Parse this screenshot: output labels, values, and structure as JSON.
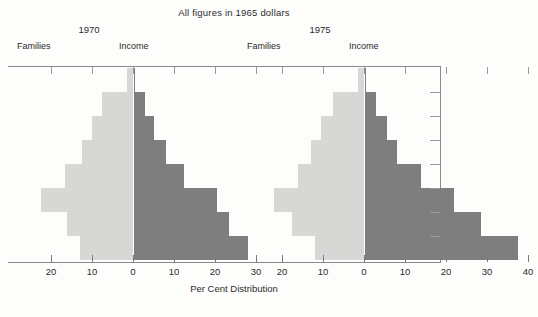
{
  "header": {
    "sup_title": "All figures in 1965 dollars",
    "axis_title": "Per Cent Distribution"
  },
  "panels": [
    {
      "year": "1970",
      "left_label": "Families",
      "right_label": "Income"
    },
    {
      "year": "1975",
      "left_label": "Families",
      "right_label": "Income"
    }
  ],
  "axis": {
    "tick_labels": [
      "20",
      "10",
      "0",
      "10",
      "20",
      "30",
      "20",
      "10",
      "0",
      "10",
      "20",
      "30",
      "40"
    ],
    "left_panel_ticks": [
      "20",
      "10",
      "0",
      "10",
      "20",
      "30"
    ],
    "right_panel_ticks": [
      "20",
      "10",
      "0",
      "10",
      "20",
      "30",
      "40"
    ],
    "units_per_tick": 10,
    "px_per_unit": 4.1
  },
  "colors": {
    "families_bar": "#d7d7d5",
    "income_bar": "#7e7e7e",
    "axis_line": "#8a8a8a",
    "text": "#2b2b2b",
    "background": "#fdfdfb"
  },
  "chart_data": {
    "type": "bar",
    "title": "All figures in 1965 dollars",
    "xlabel": "Per Cent Distribution",
    "ylabel": "",
    "orientation": "horizontal-pyramid",
    "grid": false,
    "legend_position": "inline-column-headers",
    "xlim_left_panel": [
      -24,
      30
    ],
    "xlim_right_panel": [
      -24,
      40
    ],
    "rows": 8,
    "row_height_px": 24,
    "series": [
      {
        "name": "1970 Families",
        "side": "left",
        "color": "#d7d7d5",
        "values": [
          1.5,
          7.5,
          10.0,
          12.5,
          16.5,
          22.5,
          16.0,
          13.0
        ]
      },
      {
        "name": "1970 Income",
        "side": "right",
        "color": "#7e7e7e",
        "values": [
          0.5,
          3.0,
          5.0,
          8.0,
          12.5,
          20.5,
          23.5,
          28.0
        ]
      },
      {
        "name": "1975 Families",
        "side": "left",
        "color": "#d7d7d5",
        "values": [
          1.5,
          7.5,
          10.5,
          13.0,
          16.0,
          22.0,
          17.5,
          12.0
        ]
      },
      {
        "name": "1975 Income",
        "side": "right",
        "color": "#7e7e7e",
        "values": [
          0.5,
          3.0,
          5.5,
          8.0,
          14.0,
          22.0,
          28.5,
          37.5
        ]
      }
    ]
  }
}
